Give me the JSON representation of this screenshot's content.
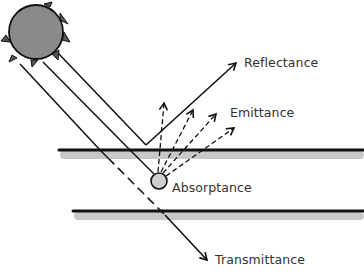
{
  "diagram": {
    "type": "radiation-surface-interaction",
    "labels": {
      "reflectance": "Reflectance",
      "emittance": "Emittance",
      "absorptance": "Absorptance",
      "transmittance": "Transmittance"
    },
    "elements": {
      "source": "sun",
      "surfaces": [
        "top-surface-layer",
        "bottom-surface-layer"
      ]
    },
    "colors": {
      "stroke": "#111111",
      "sun_fill": "#8a8a8a",
      "absorber_fill": "#cfcfcf",
      "surface_shadow": "#c8c8c8",
      "text": "#333333"
    }
  }
}
